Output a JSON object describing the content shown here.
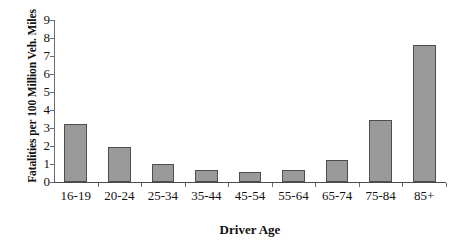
{
  "chart_data": {
    "type": "bar",
    "title": "",
    "xlabel": "Driver Age",
    "ylabel": "Fatalities per 100 Million Veh. Miles",
    "categories": [
      "16-19",
      "20-24",
      "25-34",
      "35-44",
      "45-54",
      "55-64",
      "65-74",
      "75-84",
      "85+"
    ],
    "values": [
      3.2,
      1.95,
      1.0,
      0.67,
      0.55,
      0.67,
      1.22,
      3.45,
      7.6
    ],
    "ylim": [
      0,
      9
    ],
    "yticks": [
      0,
      1,
      2,
      3,
      4,
      5,
      6,
      7,
      8,
      9
    ],
    "ytick_labels": [
      "0",
      "1",
      "2",
      "3",
      "4",
      "5",
      "6",
      "7",
      "8",
      "9"
    ],
    "grid": false,
    "legend": false,
    "bar_color": "#9a9a9a",
    "bar_border_color": "#4d4d4d",
    "axis_color": "#4a4a4a",
    "background_color": "#ffffff"
  }
}
